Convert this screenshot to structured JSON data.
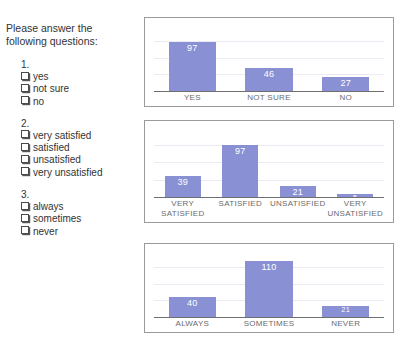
{
  "questionnaire": {
    "intro": "Please answer the following questions:",
    "checkbox_icon": "empty-checkbox-icon",
    "questions": [
      {
        "number": "1.",
        "options": [
          "yes",
          "not sure",
          "no"
        ]
      },
      {
        "number": "2.",
        "options": [
          "very satisfied",
          "satisfied",
          "unsatisfied",
          "very unsatisfied"
        ]
      },
      {
        "number": "3.",
        "options": [
          "always",
          "sometimes",
          "never"
        ]
      }
    ]
  },
  "colors": {
    "bar": "#8a90d4",
    "bar_label": "#ffffff",
    "axis": "#6f6f6f",
    "tick_label": "#6b6b6b",
    "panel_border": "#9a9a9a",
    "gridline": "#eceaf3",
    "text": "#333333"
  },
  "chart_data": [
    {
      "type": "bar",
      "title": "",
      "xlabel": "",
      "ylabel": "",
      "categories": [
        "YES",
        "NOT SURE",
        "NO"
      ],
      "values": [
        97,
        46,
        27
      ],
      "ylim": [
        0,
        120
      ],
      "grid": true,
      "legend": "none"
    },
    {
      "type": "bar",
      "title": "",
      "xlabel": "",
      "ylabel": "",
      "categories": [
        "VERY SATISFIED",
        "SATISFIED",
        "UNSATISFIED",
        "VERY UNSATISFIED"
      ],
      "values": [
        39,
        97,
        21,
        5
      ],
      "ylim": [
        0,
        120
      ],
      "grid": true,
      "legend": "none"
    },
    {
      "type": "bar",
      "title": "",
      "xlabel": "",
      "ylabel": "",
      "categories": [
        "ALWAYS",
        "SOMETIMES",
        "NEVER"
      ],
      "values": [
        40,
        110,
        21
      ],
      "ylim": [
        0,
        120
      ],
      "grid": true,
      "legend": "none"
    }
  ]
}
